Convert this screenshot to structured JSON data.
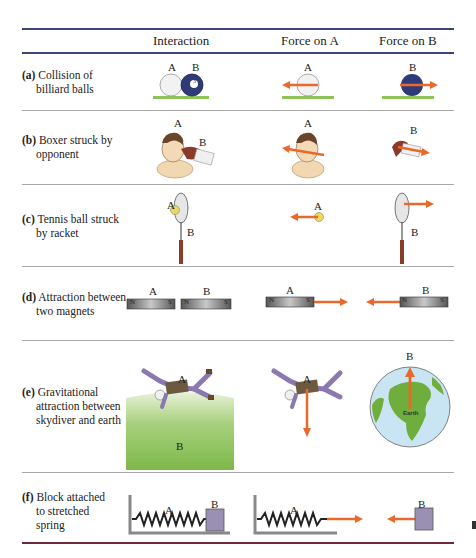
{
  "table": {
    "headers": [
      "Interaction",
      "Force on A",
      "Force on B"
    ],
    "rows": [
      {
        "tag": "(a)",
        "line1": "Collision of",
        "line2": "billiard balls",
        "labels": {
          "a": "A",
          "b": "B"
        },
        "ball_number": "3"
      },
      {
        "tag": "(b)",
        "line1": "Boxer struck by",
        "line2": "opponent",
        "labels": {
          "a": "A",
          "b": "B"
        }
      },
      {
        "tag": "(c)",
        "line1": "Tennis ball struck",
        "line2": "by racket",
        "labels": {
          "a": "A",
          "b": "B"
        }
      },
      {
        "tag": "(d)",
        "line1": "Attraction between",
        "line2": "two magnets",
        "labels": {
          "a": "A",
          "b": "B"
        },
        "poles": {
          "n": "N",
          "s": "S"
        }
      },
      {
        "tag": "(e)",
        "line1": "Gravitational",
        "line2": "attraction between",
        "line3": "skydiver and earth",
        "labels": {
          "a": "A",
          "b": "B"
        },
        "earth_label": "Earth"
      },
      {
        "tag": "(f)",
        "line1": "Block attached",
        "line2": "to stretched",
        "line3": "spring",
        "labels": {
          "a": "A",
          "b": "B"
        }
      }
    ]
  },
  "colors": {
    "arrow": "#e8692a",
    "rule_top": "#3b4578",
    "rule_bottom": "#6e2a3a",
    "ground_green": "#8cc45a",
    "ball_b": "#2f3a78",
    "earth_ocean": "#c9e4f2",
    "earth_land": "#6fae3c",
    "block": "#9a90b4"
  }
}
